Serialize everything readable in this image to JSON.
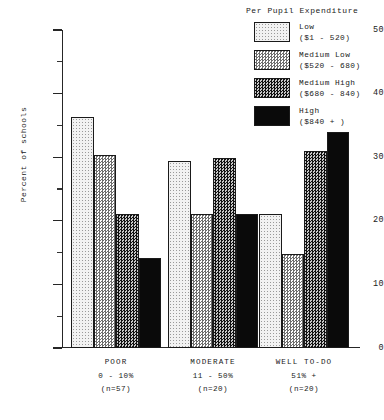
{
  "chart_data": {
    "type": "bar",
    "title": "",
    "xlabel": "",
    "ylabel": "Percent of schools",
    "ylim": [
      0,
      50
    ],
    "ytick_labels": [
      "0",
      "10",
      "20",
      "30",
      "40",
      "50"
    ],
    "ytick_values": [
      0,
      10,
      20,
      30,
      40,
      50
    ],
    "minor_tick_values": [
      5,
      15,
      25,
      35,
      45
    ],
    "grid": false,
    "legend_position": "top-right",
    "legend_title": "Per Pupil Expenditure",
    "categories": [
      "POOR 0 - 10% (n=57)",
      "MODERATE 11 - 50% (n=20)",
      "WELL TO-DO 51% + (n=20)"
    ],
    "series": [
      {
        "name": "Low",
        "range": "($1 - 520)",
        "values": [
          36.3,
          29.4,
          21.0
        ]
      },
      {
        "name": "Medium Low",
        "range": "($520 - 680)",
        "values": [
          30.3,
          21.0,
          14.8
        ]
      },
      {
        "name": "Medium High",
        "range": "($680 - 840)",
        "values": [
          21.0,
          29.8,
          31.0
        ]
      },
      {
        "name": "High",
        "range": "($840 + )",
        "values": [
          14.2,
          21.0,
          34.0
        ]
      }
    ]
  },
  "axis": {
    "y_title": "Percent of schools",
    "ticks": [
      {
        "label": "50",
        "value": 50
      },
      {
        "label": "40",
        "value": 40
      },
      {
        "label": "30",
        "value": 30
      },
      {
        "label": "20",
        "value": 20
      },
      {
        "label": "10",
        "value": 10
      },
      {
        "label": "0",
        "value": 0
      }
    ]
  },
  "groups": [
    {
      "name": "POOR",
      "range": "0 - 10%",
      "n": "(n=57)"
    },
    {
      "name": "MODERATE",
      "range": "11 - 50%",
      "n": "(n=20)"
    },
    {
      "name": "WELL TO-DO",
      "range": "51% +",
      "n": "(n=20)"
    }
  ],
  "legend": {
    "title": "Per Pupil Expenditure",
    "items": [
      {
        "label": "Low",
        "range": "($1 - 520)",
        "pattern": "fill-low"
      },
      {
        "label": "Medium Low",
        "range": "($520 - 680)",
        "pattern": "fill-medlow"
      },
      {
        "label": "Medium High",
        "range": "($680 - 840)",
        "pattern": "fill-medhigh"
      },
      {
        "label": "High",
        "range": "($840 + )",
        "pattern": "fill-high"
      }
    ]
  },
  "colors": {
    "axis": "#262626",
    "text": "#1a1a1a",
    "background": "#ffffff",
    "low": "#f2f2f2",
    "medium_low": "#bdbdbd",
    "medium_high": "#3a3a3a",
    "high": "#0a0a0a"
  }
}
